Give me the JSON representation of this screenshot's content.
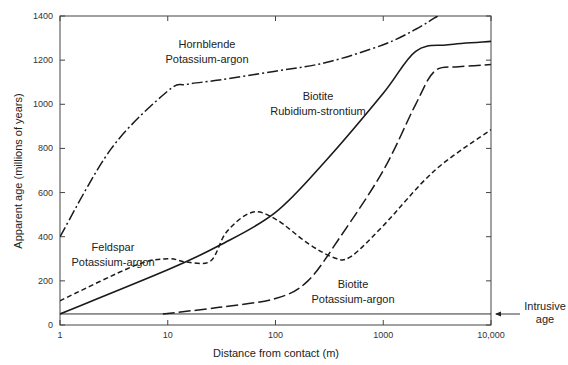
{
  "chart_data": {
    "type": "line",
    "title": "",
    "xlabel": "Distance from contact (m)",
    "ylabel": "Apparent age (millions of years)",
    "xscale": "log",
    "xlim": [
      1,
      10000
    ],
    "ylim": [
      0,
      1400
    ],
    "x_ticks": [
      "1",
      "10",
      "100",
      "1000",
      "10,000"
    ],
    "y_ticks": [
      "0",
      "200",
      "400",
      "600",
      "800",
      "1000",
      "1200",
      "1400"
    ],
    "grid": false,
    "legend": "inline labels",
    "series": [
      {
        "name": "Hornblende Potassium-argon",
        "label_lines": [
          "Hornblende",
          "Potassium-argon"
        ],
        "style": "dash-dot",
        "x": [
          1,
          3,
          10,
          15,
          30,
          100,
          300,
          1000,
          2000,
          3200
        ],
        "values": [
          400,
          800,
          1060,
          1090,
          1110,
          1150,
          1190,
          1270,
          1340,
          1400
        ]
      },
      {
        "name": "Biotite Rubidium-strontium",
        "label_lines": [
          "Biotite",
          "Rubidium-strontium"
        ],
        "style": "solid",
        "x": [
          1,
          10,
          30,
          100,
          300,
          1000,
          2000,
          4000,
          10000
        ],
        "values": [
          50,
          250,
          360,
          510,
          750,
          1050,
          1240,
          1270,
          1285
        ]
      },
      {
        "name": "Feldspar Potassium-argon",
        "label_lines": [
          "Feldspar",
          "Potassium-argon"
        ],
        "style": "short-dash",
        "x": [
          1,
          5,
          10,
          15,
          25,
          35,
          60,
          100,
          200,
          350,
          500,
          1000,
          3000,
          10000
        ],
        "values": [
          110,
          270,
          300,
          285,
          290,
          420,
          510,
          480,
          370,
          305,
          310,
          450,
          700,
          885
        ]
      },
      {
        "name": "Biotite Potassium-argon",
        "label_lines": [
          "Biotite",
          "Potassium-argon"
        ],
        "style": "long-dash",
        "x": [
          9,
          30,
          100,
          200,
          400,
          1000,
          2000,
          3000,
          5000,
          10000
        ],
        "values": [
          50,
          80,
          120,
          200,
          400,
          700,
          1000,
          1150,
          1170,
          1180
        ]
      },
      {
        "name": "Intrusive age",
        "style": "thin-solid",
        "x": [
          1,
          10000
        ],
        "values": [
          50,
          50
        ]
      }
    ],
    "annotations": [
      {
        "text_lines": [
          "Intrusive",
          "age"
        ],
        "arrow": "left",
        "points_to": 50
      }
    ]
  }
}
